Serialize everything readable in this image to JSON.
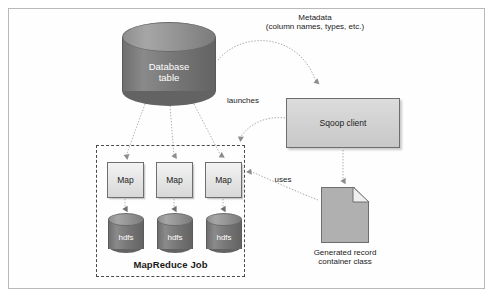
{
  "figure": {
    "background": "#ffffff",
    "frame_color": "#b9b9b9"
  },
  "nodes": {
    "database": {
      "label_line1": "Database",
      "label_line2": "table",
      "shape": "cylinder",
      "fill": "#777777",
      "text_color": "#ffffff"
    },
    "sqoop_client": {
      "label": "Sqoop client",
      "shape": "rectangle",
      "fill": "#d2d2d2"
    },
    "generated_record": {
      "label_line1": "Generated record",
      "label_line2": "container class",
      "shape": "document",
      "fill": "#b0b0b0"
    },
    "mapreduce_job": {
      "label": "MapReduce Job",
      "shape": "dashed-rectangle",
      "border_color": "#4a4a4a"
    },
    "maps": [
      {
        "label": "Map"
      },
      {
        "label": "Map"
      },
      {
        "label": "Map"
      }
    ],
    "hdfs": [
      {
        "label": "hdfs"
      },
      {
        "label": "hdfs"
      },
      {
        "label": "hdfs"
      }
    ]
  },
  "edges": {
    "metadata": {
      "label_line1": "Metadata",
      "label_line2": "(column names, types, etc.)",
      "from": "database",
      "to": "sqoop_client",
      "style": "dotted-curve-arrow"
    },
    "launches": {
      "label": "launches",
      "from": "sqoop_client",
      "to": "mapreduce_job",
      "style": "dotted-curve-arrow"
    },
    "uses": {
      "label": "uses",
      "from": "generated_record",
      "to": "mapreduce_job",
      "style": "dotted-arrow"
    },
    "sqoop_to_doc": {
      "label": "",
      "from": "sqoop_client",
      "to": "generated_record",
      "style": "dotted-arrow"
    },
    "db_to_maps": {
      "label": "",
      "from": "database",
      "to": "maps",
      "style": "dotted-arrow",
      "count": 3
    },
    "map_to_hdfs": {
      "label": "",
      "from": "maps",
      "to": "hdfs",
      "style": "dotted-arrow",
      "count": 3
    }
  }
}
